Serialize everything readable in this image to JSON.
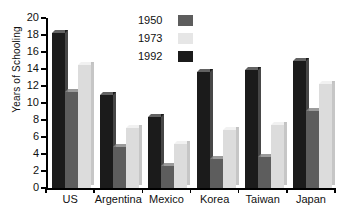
{
  "chart_data": {
    "type": "bar",
    "title": "",
    "xlabel": "",
    "ylabel": "Years of Schooling",
    "ylim": [
      0,
      20
    ],
    "ytick_step": 2,
    "yticks": [
      "0",
      "2",
      "4",
      "6",
      "8",
      "10",
      "12",
      "14",
      "16",
      "18",
      "20"
    ],
    "grid": false,
    "legend_position": "top-center",
    "categories": [
      "US",
      "Argentina",
      "Mexico",
      "Korea",
      "Taiwan",
      "Japan"
    ],
    "series": [
      {
        "name": "1950",
        "color": "#5d5d5d",
        "values": [
          11.3,
          4.8,
          2.6,
          3.4,
          3.6,
          9.1
        ]
      },
      {
        "name": "1973",
        "color": "#e6e6e6",
        "values": [
          14.5,
          7.1,
          5.2,
          6.8,
          7.4,
          12.2
        ]
      },
      {
        "name": "1992",
        "color": "#1b1b1b",
        "values": [
          18.2,
          10.9,
          8.3,
          13.6,
          13.9,
          14.9
        ]
      }
    ],
    "bar_draw_order": [
      "1992",
      "1950",
      "1973"
    ],
    "bar_draw_shades": [
      "#1b1b1b",
      "#5d5d5d",
      "#dcdcdc"
    ]
  },
  "axis": {
    "y_label": "Years of Schooling",
    "y_ticks": [
      "20",
      "18",
      "16",
      "14",
      "12",
      "10",
      "8",
      "6",
      "4",
      "2",
      "0"
    ]
  },
  "legend": {
    "items": [
      {
        "label": "1950",
        "swatch": "#5d5d5d"
      },
      {
        "label": "1973",
        "swatch": "#e6e6e6"
      },
      {
        "label": "1992",
        "swatch": "#1b1b1b"
      }
    ]
  },
  "categories": [
    "US",
    "Argentina",
    "Mexico",
    "Korea",
    "Taiwan",
    "Japan"
  ]
}
